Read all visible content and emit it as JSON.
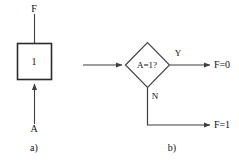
{
  "figure": {
    "background_color": "#ffffff",
    "line_color": "#3d3d3d",
    "text_color": "#111111",
    "panels": [
      {
        "id": "panel-a",
        "caption": "a)",
        "type": "block-symbol",
        "block_label": "1",
        "output_label": "F",
        "input_label": "A"
      },
      {
        "id": "panel-b",
        "caption": "b)",
        "type": "flowchart",
        "decision_label": "A=1?",
        "yes_label": "Y",
        "no_label": "N",
        "yes_output_label": "F=0",
        "no_output_label": "F=1"
      }
    ]
  }
}
